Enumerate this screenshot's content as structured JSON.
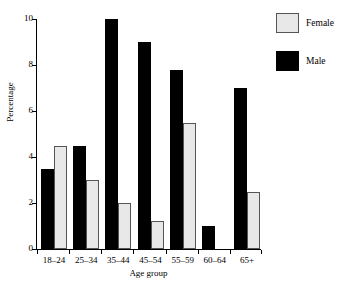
{
  "top_caption": "",
  "legend": {
    "position": "right",
    "entries": [
      {
        "label": "Female",
        "swatch": "female-swatch",
        "color": "#e8e8e8"
      },
      {
        "label": "Male",
        "swatch": "male-swatch",
        "color": "#000000"
      }
    ]
  },
  "chart_data": {
    "type": "bar",
    "title": "",
    "xlabel": "Age group",
    "ylabel": "Percentage",
    "ylim": [
      0,
      10
    ],
    "yticks": [
      0,
      2,
      4,
      6,
      8,
      10
    ],
    "ytick_labels": [
      "0",
      "2",
      "4",
      "6",
      "8",
      "10"
    ],
    "grid": false,
    "legend_position": "right",
    "categories": [
      "18–24",
      "25–34",
      "35–44",
      "45–54",
      "55–59",
      "60–64",
      "65+"
    ],
    "series": [
      {
        "name": "Male",
        "color": "#000000",
        "values": [
          3.5,
          4.5,
          10.0,
          9.0,
          7.8,
          1.0,
          7.0
        ]
      },
      {
        "name": "Female",
        "color": "#e8e8e8",
        "values": [
          4.5,
          3.0,
          2.0,
          1.2,
          5.5,
          0,
          2.5
        ]
      }
    ]
  }
}
